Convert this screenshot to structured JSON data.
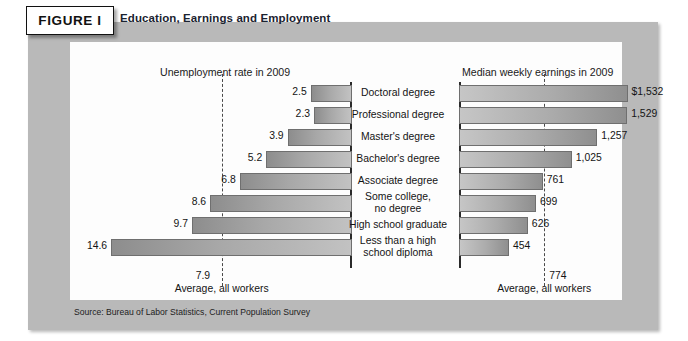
{
  "figure": {
    "badge": "FIGURE I",
    "title": "Education, Earnings and Employment",
    "source": "Source: Bureau of Labor Statistics, Current Population Survey"
  },
  "left_panel": {
    "header": "Unemployment rate in 2009",
    "average_value": "7.9",
    "average_caption": "Average, all workers"
  },
  "right_panel": {
    "header": "Median weekly earnings in 2009",
    "average_value": "774",
    "average_caption": "Average, all workers"
  },
  "categories": [
    "Doctoral degree",
    "Professional degree",
    "Master's degree",
    "Bachelor's degree",
    "Associate degree",
    "Some college,\nno degree",
    "High school graduate",
    "Less than a high\nschool diploma"
  ],
  "unemployment_labels": [
    "2.5",
    "2.3",
    "3.9",
    "5.2",
    "6.8",
    "8.6",
    "9.7",
    "14.6"
  ],
  "earnings_labels": [
    "$1,532",
    "1,529",
    "1,257",
    "1,025",
    "761",
    "699",
    "626",
    "454"
  ],
  "chart_data": [
    {
      "type": "bar",
      "title": "Unemployment rate in 2009",
      "orientation": "horizontal",
      "direction": "right-to-left",
      "xlabel": "Unemployment rate (percent)",
      "ylabel": "",
      "categories": [
        "Doctoral degree",
        "Professional degree",
        "Master's degree",
        "Bachelor's degree",
        "Associate degree",
        "Some college, no degree",
        "High school graduate",
        "Less than a high school diploma"
      ],
      "values": [
        2.5,
        2.3,
        3.9,
        5.2,
        6.8,
        8.6,
        9.7,
        14.6
      ],
      "xlim": [
        0,
        16
      ],
      "grid": false,
      "legend": false,
      "reference_line": {
        "value": 7.9,
        "label": "Average, all workers",
        "style": "dashed"
      }
    },
    {
      "type": "bar",
      "title": "Median weekly earnings in 2009",
      "orientation": "horizontal",
      "direction": "left-to-right",
      "xlabel": "Median weekly earnings (dollars)",
      "ylabel": "",
      "categories": [
        "Doctoral degree",
        "Professional degree",
        "Master's degree",
        "Bachelor's degree",
        "Associate degree",
        "Some college, no degree",
        "High school graduate",
        "Less than a high school diploma"
      ],
      "values": [
        1532,
        1529,
        1257,
        1025,
        761,
        699,
        626,
        454
      ],
      "xlim": [
        0,
        1700
      ],
      "grid": false,
      "legend": false,
      "reference_line": {
        "value": 774,
        "label": "Average, all workers",
        "style": "dashed"
      }
    }
  ]
}
